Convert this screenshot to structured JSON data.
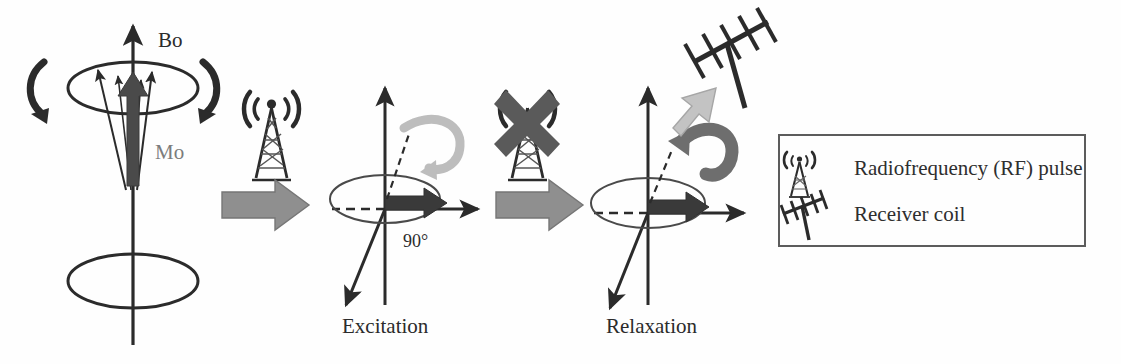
{
  "figure": {
    "type": "diagram",
    "background_color": "#fefefe"
  },
  "colors": {
    "ink": "#2b2b2b",
    "mid_gray": "#7c7c7c",
    "block_arrow_gray": "#8f8f8f",
    "light_arrow_gray": "#bdbdbd",
    "dark_arrow_gray": "#6e6e6e",
    "legend_border": "#5c5c5c",
    "magnetization_fill": "#3a3a3a"
  },
  "panels": {
    "equilibrium": {
      "name": "equilibrium-precession-panel",
      "labels": {
        "field_axis": "Bo",
        "magnetization": "Mo"
      },
      "elements": [
        "vertical-field-axis",
        "top-precession-cone-ellipse",
        "bottom-cone-ellipse",
        "net-magnetization-arrow",
        "spin-vectors",
        "precession-arrow-left",
        "precession-arrow-right"
      ]
    },
    "excitation": {
      "name": "excitation-panel",
      "caption": "Excitation",
      "flip_angle": "90°",
      "elements": [
        "z-axis",
        "x-axis",
        "y-axis",
        "transverse-plane-ellipse",
        "transverse-magnetization-arrow",
        "flip-curved-arrow",
        "dashed-tip-line"
      ]
    },
    "relaxation": {
      "name": "relaxation-panel",
      "caption": "Relaxation",
      "elements": [
        "z-axis",
        "x-axis",
        "y-axis",
        "transverse-plane-ellipse",
        "transverse-magnetization-arrow",
        "recovery-curved-arrow",
        "dashed-tip-line",
        "signal-emission-arrow"
      ]
    }
  },
  "icons": {
    "rf_transmitter": {
      "name": "rf-antenna-tower-icon",
      "state": "transmitting"
    },
    "rf_transmitter_off": {
      "name": "rf-antenna-tower-off-icon",
      "state": "off",
      "overlay": "x-cross"
    },
    "receiver_coil": {
      "name": "receiver-yagi-antenna-icon"
    },
    "step_arrow_1": {
      "name": "step-block-arrow-icon"
    },
    "step_arrow_2": {
      "name": "step-block-arrow-icon"
    }
  },
  "legend": {
    "title": "",
    "items": [
      {
        "icon": "rf-antenna-tower-icon",
        "label": "Radiofrequency (RF) pulse"
      },
      {
        "icon": "receiver-yagi-antenna-icon",
        "label": "Receiver coil"
      }
    ]
  }
}
